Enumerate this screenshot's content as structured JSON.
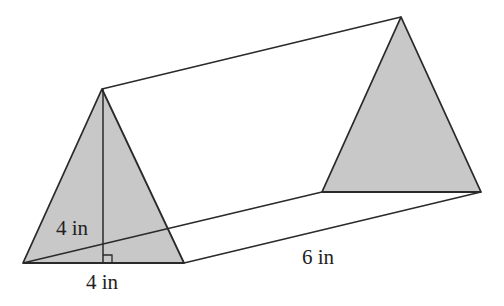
{
  "diagram": {
    "type": "triangular-prism",
    "colors": {
      "face_fill": "#c8c8c8",
      "stroke": "#2a2a2a",
      "background": "#ffffff"
    },
    "labels": {
      "height": "4 in",
      "base": "4 in",
      "length": "6 in"
    }
  }
}
